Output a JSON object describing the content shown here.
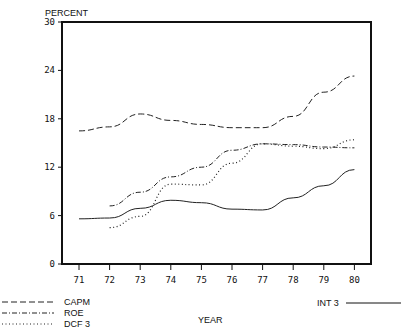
{
  "chart_data": {
    "type": "line",
    "title": "",
    "ylabel": "PERCENT",
    "xlabel": "YEAR",
    "x": [
      "71",
      "72",
      "73",
      "74",
      "75",
      "76",
      "77",
      "78",
      "79",
      "80"
    ],
    "ylim": [
      0,
      30
    ],
    "yticks": [
      "0",
      "6",
      "12",
      "18",
      "24",
      "30"
    ],
    "grid": false,
    "legend_position": "bottom",
    "series": [
      {
        "name": "CAPM",
        "style": "dashed",
        "values": [
          16.5,
          17.0,
          18.6,
          17.8,
          17.3,
          16.9,
          16.9,
          18.3,
          21.3,
          23.3
        ]
      },
      {
        "name": "ROE",
        "style": "dash-dot",
        "values": [
          null,
          7.2,
          8.9,
          10.8,
          12.0,
          14.1,
          14.9,
          14.8,
          14.5,
          14.4
        ]
      },
      {
        "name": "DCF 3",
        "style": "dotted",
        "values": [
          null,
          4.5,
          5.9,
          9.9,
          9.8,
          12.5,
          14.9,
          14.6,
          14.3,
          15.4
        ]
      },
      {
        "name": "INT 3",
        "style": "solid",
        "values": [
          5.6,
          5.7,
          6.9,
          7.9,
          7.6,
          6.8,
          6.7,
          8.2,
          9.7,
          11.7
        ]
      }
    ]
  },
  "legend": {
    "left": [
      {
        "label": "CAPM",
        "style": "dashed"
      },
      {
        "label": "ROE",
        "style": "dash-dot"
      },
      {
        "label": "DCF 3",
        "style": "dotted"
      }
    ],
    "right": {
      "label": "INT 3",
      "style": "solid"
    }
  },
  "colors": {
    "ink": "#111111",
    "background": "#ffffff"
  }
}
